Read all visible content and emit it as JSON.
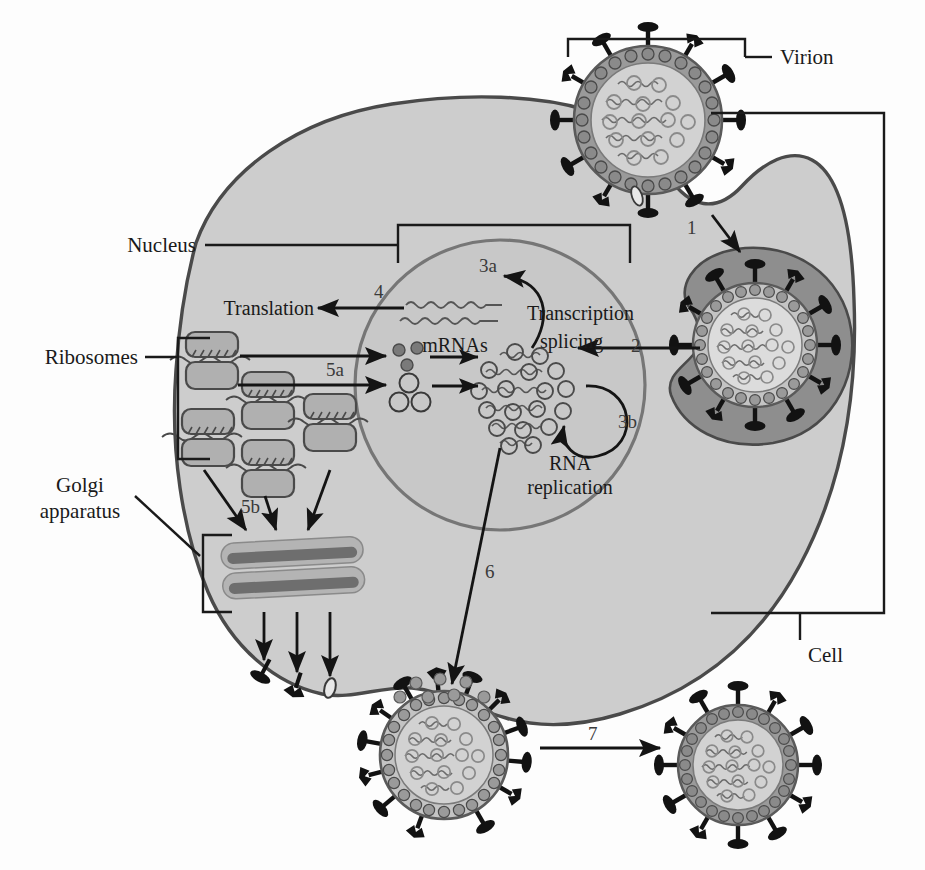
{
  "figure": {
    "type": "diagram",
    "background_color": "#fdfdfd"
  },
  "colors": {
    "cell_fill": "#cdcdcd",
    "cell_stroke": "#4a4a4a",
    "nucleus_fill": "#c8c8c8",
    "nucleus_stroke": "#707070",
    "envelope_fill": "#9a9a9a",
    "capsid_fill": "#d2d2d2",
    "spike_color": "#121212",
    "endosome_fill": "#8e8e8e",
    "golgi_light": "#b4b4b4",
    "golgi_dark": "#6e6e6e",
    "ribosome_fill": "#b0b0b0",
    "ribosome_stroke": "#4a4a4a",
    "text_color": "#1a1a1a",
    "number_color": "#3a3a3a",
    "rna_color": "#555555"
  },
  "labels": {
    "virion": "Virion",
    "cell": "Cell",
    "nucleus": "Nucleus",
    "ribosomes": "Ribosomes",
    "golgi_line1": "Golgi",
    "golgi_line2": "apparatus",
    "translation": "Translation",
    "mrnas": "mRNAs",
    "transcription": "Transcription",
    "splicing": "splicing",
    "rna_line1": "RNA",
    "rna_line2": "replication"
  },
  "steps": [
    {
      "id": "1",
      "label": "1",
      "meaning": "virion attachment and endocytosis"
    },
    {
      "id": "2",
      "label": "2",
      "meaning": "genome release into nucleus"
    },
    {
      "id": "3a",
      "label": "3a",
      "meaning": "transcription and splicing"
    },
    {
      "id": "3b",
      "label": "3b",
      "meaning": "RNA replication"
    },
    {
      "id": "4",
      "label": "4",
      "meaning": "mRNA export for translation"
    },
    {
      "id": "5a",
      "label": "5a",
      "meaning": "viral proteins into nucleus"
    },
    {
      "id": "5b",
      "label": "5b",
      "meaning": "proteins to Golgi apparatus"
    },
    {
      "id": "6",
      "label": "6",
      "meaning": "nucleocapsid to budding site"
    },
    {
      "id": "7",
      "label": "7",
      "meaning": "release of progeny virion"
    }
  ],
  "virions": [
    {
      "name": "entering-virion",
      "position": "top",
      "state": "attached at cell surface"
    },
    {
      "name": "endosome-virion",
      "position": "upper-right",
      "state": "inside endosome"
    },
    {
      "name": "budding-virion",
      "position": "bottom-center",
      "state": "budding from membrane"
    },
    {
      "name": "released-virion",
      "position": "bottom-right",
      "state": "released progeny"
    }
  ],
  "organelles": [
    {
      "name": "nucleus",
      "label": "Nucleus"
    },
    {
      "name": "ribosomes",
      "label": "Ribosomes"
    },
    {
      "name": "golgi-apparatus",
      "label": "Golgi apparatus"
    }
  ]
}
